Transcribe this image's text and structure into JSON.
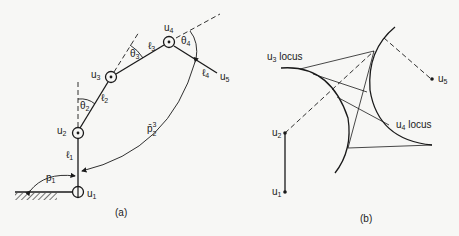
{
  "panel_a": {
    "caption": "(a)",
    "joints": [
      {
        "label": "u",
        "sub": "1"
      },
      {
        "label": "u",
        "sub": "2"
      },
      {
        "label": "u",
        "sub": "3"
      },
      {
        "label": "u",
        "sub": "4"
      },
      {
        "label": "u",
        "sub": "5"
      }
    ],
    "links": [
      {
        "label": "ℓ",
        "sub": "1"
      },
      {
        "label": "ℓ",
        "sub": "2"
      },
      {
        "label": "ℓ",
        "sub": "3"
      },
      {
        "label": "ℓ",
        "sub": "4"
      }
    ],
    "angles": [
      {
        "label": "θ",
        "sub": "2"
      },
      {
        "label": "θ",
        "sub": "3"
      },
      {
        "label": "θ",
        "sub": "4"
      }
    ],
    "base_angle": {
      "label": "p",
      "sub": "1"
    },
    "span_vector": {
      "label": "p̄",
      "sub": "2",
      "sup": "3"
    }
  },
  "panel_b": {
    "caption": "(b)",
    "joints": [
      {
        "label": "u",
        "sub": "1"
      },
      {
        "label": "u",
        "sub": "2"
      },
      {
        "label": "u",
        "sub": "5"
      }
    ],
    "loci": [
      {
        "label": "u",
        "sub": "3",
        "suffix": " locus"
      },
      {
        "label": "u",
        "sub": "4",
        "suffix": " locus"
      }
    ]
  }
}
